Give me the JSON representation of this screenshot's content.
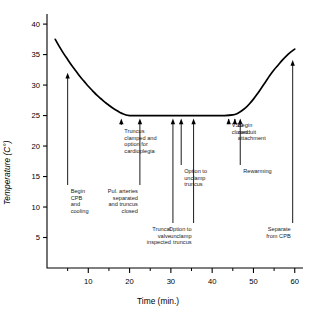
{
  "chart_data": {
    "type": "line",
    "title": "",
    "xlabel": "Time (min.)",
    "ylabel": "Temperature (C°)",
    "xlim": [
      0,
      62
    ],
    "ylim": [
      0,
      41
    ],
    "xticks": [
      10,
      20,
      30,
      40,
      50,
      60
    ],
    "yticks": [
      5,
      10,
      15,
      20,
      25,
      30,
      35,
      40
    ],
    "minor_xticks": [
      5,
      15,
      25,
      35,
      45,
      55
    ],
    "grid": false,
    "legend": null,
    "series": [
      {
        "name": "Core temperature",
        "x": [
          2,
          3,
          4,
          5,
          6,
          7,
          8,
          9,
          10,
          11,
          12,
          13,
          14,
          15,
          16,
          17,
          18,
          20,
          25,
          30,
          35,
          40,
          43,
          45,
          46,
          47,
          48,
          49,
          50,
          51,
          52,
          53,
          54,
          55,
          56,
          57,
          58,
          59,
          60
        ],
        "y": [
          37.5,
          36.3,
          35.2,
          34.2,
          33.2,
          32.3,
          31.4,
          30.6,
          29.8,
          29.1,
          28.4,
          27.8,
          27.2,
          26.7,
          26.2,
          25.8,
          25.4,
          25.0,
          25.0,
          25.0,
          25.0,
          25.0,
          25.0,
          25.1,
          25.3,
          25.7,
          26.2,
          26.9,
          27.7,
          28.6,
          29.6,
          30.6,
          31.6,
          32.5,
          33.3,
          34.1,
          34.8,
          35.4,
          35.9
        ]
      }
    ],
    "annotations": [
      {
        "label": "Begin\nCPB\nand\ncooling",
        "x_value": 5,
        "align": "left",
        "arrow_tip_y": 32.5
      },
      {
        "label": "Truncus\nclamped and\noption for\ncardioplegia",
        "x_value": 18,
        "align": "left",
        "arrow_tip_y": 25.0
      },
      {
        "label": "Pul. arteries\nseparated\nand truncus\nclosed",
        "x_value": 22.5,
        "align": "right",
        "arrow_tip_y": 25.0
      },
      {
        "label": "Truncal\nvalve\ninspected",
        "x_value": 30.5,
        "align": "right",
        "arrow_tip_y": 25.0
      },
      {
        "label": "Option to\nunclamp\ntruncus",
        "x_value": 32.5,
        "align": "left",
        "arrow_tip_y": 25.0
      },
      {
        "label": "Option to\nunclamp\ntruncus",
        "x_value": 35.5,
        "align": "right",
        "arrow_tip_y": 25.0
      },
      {
        "label": "VSD\nclosed",
        "x_value": 44,
        "align": "left",
        "arrow_tip_y": 25.0
      },
      {
        "label": "Begin\nconduit\nattachment",
        "x_value": 45.5,
        "align": "left",
        "arrow_tip_y": 25.0
      },
      {
        "label": "Rewarming",
        "x_value": 46.8,
        "align": "left",
        "arrow_tip_y": 25.0
      },
      {
        "label": "Separate\nfrom CPB",
        "x_value": 59.5,
        "align": "right",
        "arrow_tip_y": 34.6
      }
    ]
  },
  "axes": {
    "x_title": "Time (min.)",
    "y_title": "Temperature (C°)",
    "x_tick_labels": [
      "10",
      "20",
      "30",
      "40",
      "50",
      "60"
    ],
    "y_tick_labels": [
      "40",
      "35",
      "30",
      "25",
      "20",
      "15",
      "10",
      "5"
    ]
  },
  "annotation_text": {
    "begin_cpb": "Begin\nCPB\nand\ncooling",
    "truncus_clamped": "Truncus\nclamped and\noption for\ncardioplegia",
    "pul_arteries": "Pul. arteries\nseparated\nand truncus\nclosed",
    "truncal_valve": "Truncal\nvalve\ninspected",
    "option_unclamp_upper": "Option to\nunclamp\ntruncus",
    "option_unclamp_lower": "Option to\nunclamp\ntruncus",
    "vsd_closed": "VSD\nclosed",
    "begin_conduit": "Begin\nconduit\nattachment",
    "rewarming": "Rewarming",
    "separate_cpb": "Separate\nfrom CPB"
  },
  "style": {
    "line_color": "#000000",
    "axis_color": "#000000",
    "background": "#ffffff"
  }
}
